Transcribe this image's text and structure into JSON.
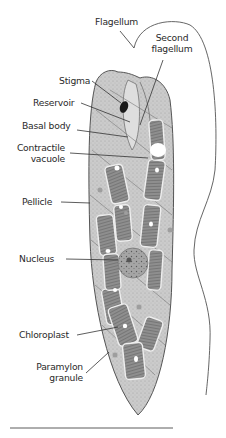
{
  "diagram": {
    "colors": {
      "cell_fill": "#c9c9c9",
      "chloroplast_fill": "#8a8a8a",
      "stigma_fill": "#1a1a1a",
      "outline": "#555555",
      "label_text": "#2a2a2a",
      "leader_line": "#333333"
    },
    "labels": [
      {
        "id": "flagellum",
        "text": "Flagellum"
      },
      {
        "id": "second-flagellum",
        "line1": "Second",
        "line2": "flagellum"
      },
      {
        "id": "stigma",
        "text": "Stigma"
      },
      {
        "id": "reservoir",
        "text": "Reservoir"
      },
      {
        "id": "basal-body",
        "text": "Basal body"
      },
      {
        "id": "contractile-vacuole",
        "line1": "Contractile",
        "line2": "vacuole"
      },
      {
        "id": "pellicle",
        "text": "Pellicle"
      },
      {
        "id": "nucleus",
        "text": "Nucleus"
      },
      {
        "id": "chloroplast",
        "text": "Chloroplast"
      },
      {
        "id": "paramylon-granule",
        "line1": "Paramylon",
        "line2": "granule"
      }
    ]
  }
}
